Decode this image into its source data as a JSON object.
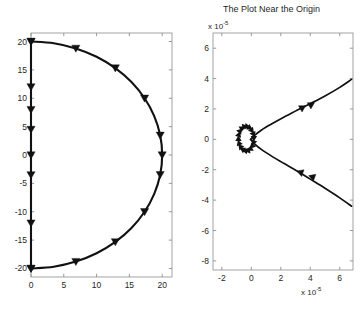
{
  "figure": {
    "width": 362,
    "height": 309,
    "background": "#ffffff",
    "line_color": "#111111",
    "axis_color": "#9a9a9a"
  },
  "panels": [
    {
      "id": "left",
      "title": "",
      "xlabel": "",
      "ylabel": "",
      "x_ticks": [
        "0",
        "5",
        "10",
        "15",
        "20"
      ],
      "y_ticks": [
        "20",
        "15",
        "10",
        "5",
        "0",
        "-5",
        "-10",
        "-15",
        "-20"
      ],
      "x_exponent": "",
      "y_exponent": ""
    },
    {
      "id": "right",
      "title": "The Plot Near the Origin",
      "xlabel": "",
      "ylabel": "",
      "x_ticks": [
        "-2",
        "0",
        "2",
        "4",
        "6"
      ],
      "y_ticks": [
        "6",
        "4",
        "2",
        "0",
        "-2",
        "-4",
        "-6",
        "-8"
      ],
      "x_exponent_prefix": "x 10",
      "x_exponent_power": "-5",
      "y_exponent_prefix": "x 10",
      "y_exponent_power": "-5"
    }
  ],
  "chart_data": [
    {
      "type": "line",
      "id": "left-plot",
      "title": "",
      "xlabel": "",
      "ylabel": "",
      "xlim": [
        0,
        21.5
      ],
      "ylim": [
        -21.5,
        21.5
      ],
      "xticks": [
        0,
        5,
        10,
        15,
        20
      ],
      "yticks": [
        -20,
        -15,
        -10,
        -5,
        0,
        5,
        10,
        15,
        20
      ],
      "grid": false,
      "legend": null,
      "marker": "triangle-down",
      "series": [
        {
          "name": "semicircular-arc",
          "comment": "Right-half circle of radius 20 centered at origin, traversed from (0,20) to (20,0) to (0,-20)",
          "x": [
            0.0,
            3.47,
            6.84,
            10.0,
            12.86,
            15.32,
            17.32,
            18.79,
            19.7,
            20.0,
            19.7,
            18.79,
            17.32,
            15.32,
            12.86,
            10.0,
            6.84,
            3.47,
            0.0
          ],
          "y": [
            20.0,
            19.7,
            18.79,
            17.32,
            15.32,
            12.86,
            10.0,
            6.84,
            3.47,
            0.0,
            -3.47,
            -6.84,
            -10.0,
            -12.86,
            -15.32,
            -17.32,
            -18.79,
            -19.7,
            -20.0
          ],
          "marker_x": [
            0.0,
            6.84,
            12.86,
            17.32,
            19.7,
            20.0,
            19.7,
            17.32,
            12.86,
            6.84,
            0.0
          ],
          "marker_y": [
            20.0,
            18.79,
            15.32,
            10.0,
            3.47,
            0.0,
            -3.47,
            -10.0,
            -15.32,
            -18.79,
            -20.0
          ]
        },
        {
          "name": "vertical-segment",
          "comment": "Straight segment along x = 0 from y = 20 down to y = -20",
          "x": [
            0.0,
            0.0
          ],
          "y": [
            20.0,
            -20.0
          ],
          "marker_x": [
            0.0,
            0.0,
            0.0,
            0.0,
            0.0,
            0.0,
            0.0,
            0.0
          ],
          "marker_y": [
            20.0,
            12.0,
            4.5,
            0.0,
            -3.5,
            -12.0,
            -20.0,
            8.0
          ]
        }
      ]
    },
    {
      "type": "line",
      "id": "right-plot",
      "title": "The Plot Near the Origin",
      "xlabel": "",
      "ylabel": "",
      "x_scale_exponent": -5,
      "y_scale_exponent": -5,
      "xlim": [
        -2.6,
        6.9
      ],
      "ylim": [
        -8.6,
        7.0
      ],
      "xticks": [
        -2,
        0,
        2,
        4,
        6
      ],
      "yticks": [
        -8,
        -6,
        -4,
        -2,
        0,
        2,
        4,
        6
      ],
      "grid": false,
      "legend": null,
      "marker": "triangle",
      "series": [
        {
          "name": "upper-branch",
          "comment": "Units of 1e-5; rises from the origin cluster toward upper right",
          "x": [
            -0.05,
            0.2,
            0.7,
            1.4,
            2.2,
            3.1,
            4.0,
            5.0,
            6.0,
            6.8
          ],
          "y": [
            0.0,
            0.25,
            0.62,
            1.02,
            1.45,
            1.92,
            2.35,
            2.85,
            3.42,
            3.95
          ],
          "marker_x": [
            3.4,
            4.0
          ],
          "marker_y": [
            2.1,
            2.3
          ]
        },
        {
          "name": "lower-branch",
          "comment": "Units of 1e-5; falls from the origin cluster toward lower right",
          "x": [
            -0.05,
            0.2,
            0.7,
            1.4,
            2.2,
            3.1,
            4.0,
            5.0,
            6.0,
            6.8
          ],
          "y": [
            0.0,
            -0.28,
            -0.68,
            -1.12,
            -1.58,
            -2.08,
            -2.62,
            -3.22,
            -3.85,
            -4.4
          ],
          "marker_x": [
            3.4,
            4.2
          ],
          "marker_y": [
            -2.15,
            -2.45
          ]
        },
        {
          "name": "origin-cluster",
          "comment": "Dense knot of overlapping triangle markers at the origin",
          "center_x": -0.35,
          "center_y": 0.05,
          "radius_x": 0.55,
          "radius_y": 0.85
        }
      ]
    }
  ]
}
